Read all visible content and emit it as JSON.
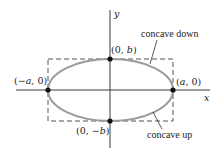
{
  "diagram": {
    "type": "ellipse-concavity",
    "colors": {
      "axis": "#3a3a3a",
      "ellipse": "#9a9a9a",
      "bounding_box": "#555555",
      "point": "#111111",
      "text": "#222222"
    },
    "axes": {
      "x_label": "x",
      "y_label": "y"
    },
    "points": [
      {
        "id": "top",
        "label_prefix": "(0, ",
        "label_var": "b",
        "label_suffix": ")"
      },
      {
        "id": "bottom",
        "label_prefix": "(0, −",
        "label_var": "b",
        "label_suffix": ")"
      },
      {
        "id": "left",
        "label_prefix": "(−",
        "label_var": "a",
        "label_suffix": ", 0)"
      },
      {
        "id": "right",
        "label_prefix": "(",
        "label_var": "a",
        "label_suffix": ", 0)"
      }
    ],
    "annotations": {
      "upper": "concave down",
      "lower": "concave up"
    }
  }
}
